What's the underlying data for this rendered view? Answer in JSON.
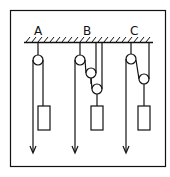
{
  "diagram": {
    "labels": {
      "a": "A",
      "b": "B",
      "c": "C"
    },
    "colors": {
      "stroke": "#111111",
      "background": "#ffffff"
    },
    "systems": [
      {
        "id": "A",
        "description": "Single fixed pulley; load hangs from one side, effort pulled downward on other side"
      },
      {
        "id": "B",
        "description": "Fixed pulley with two lower movable pulleys; effort pulled downward"
      },
      {
        "id": "C",
        "description": "Fixed pulley with one movable pulley; effort pulled downward"
      }
    ]
  }
}
